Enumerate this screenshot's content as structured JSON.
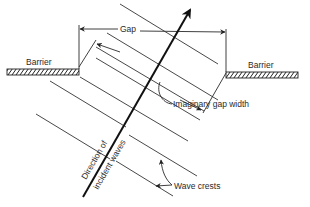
{
  "figure": {
    "type": "diagram"
  },
  "labels": {
    "gap": "Gap",
    "barrier_left": "Barrier",
    "barrier_right": "Barrier",
    "imaginary_gap_width": "Imaginary gap width",
    "direction_line1": "Direction of",
    "direction_line2": "incident waves",
    "wave_crests": "Wave crests"
  },
  "colors": {
    "background": "#ffffff",
    "ink": "#2a2a2a"
  }
}
